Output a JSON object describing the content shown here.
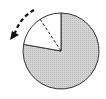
{
  "diagram": {
    "type": "pie-rotation",
    "circle": {
      "cx": 61,
      "cy": 51,
      "r": 38
    },
    "shaded_fraction": 0.78,
    "unshaded_wedge": {
      "start_angle_deg": 90,
      "end_angle_deg": 170
    },
    "dashed_radius_angle_deg": 122,
    "rotation_direction": "counterclockwise",
    "colors": {
      "shaded": "#cfcfcf",
      "outline": "#333333",
      "unshaded": "#ffffff",
      "arrow": "#111111"
    }
  }
}
